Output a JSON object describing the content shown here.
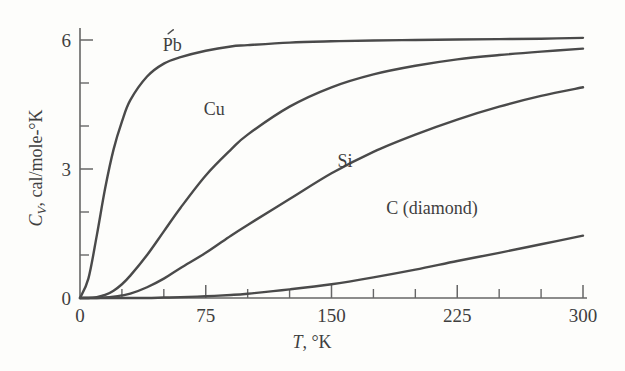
{
  "figure": {
    "background_color": "#fdfdfb",
    "ink_color": "#4a4a4a",
    "axis_color": "#666666"
  },
  "chart_data": {
    "type": "line",
    "title": "",
    "subtitle": "",
    "xlabel_parts": {
      "symbol": "T",
      "rest": ", °K"
    },
    "xlabel": "T, °K",
    "ylabel_parts": {
      "symbol": "C",
      "subscript": "V",
      "rest": ", cal/mole-°K"
    },
    "ylabel": "C_V, cal/mole-°K",
    "xlim": [
      0,
      300
    ],
    "ylim": [
      0,
      6.3
    ],
    "grid": false,
    "legend_position": "inline-curve-labels",
    "x_major_ticks": [
      0,
      75,
      150,
      225,
      300
    ],
    "x_major_tick_labels": [
      "0",
      "75",
      "150",
      "225",
      "300"
    ],
    "x_minor_ticks": [
      25,
      50,
      100,
      125,
      175,
      200,
      250,
      275
    ],
    "y_major_ticks": [
      0,
      3,
      6
    ],
    "y_major_tick_labels": [
      "0",
      "3",
      "6"
    ],
    "y_minor_ticks": [
      1,
      2,
      4,
      5
    ],
    "x": [
      0,
      5,
      10,
      15,
      20,
      25,
      30,
      40,
      50,
      60,
      75,
      90,
      100,
      125,
      150,
      175,
      200,
      225,
      250,
      275,
      300
    ],
    "series": [
      {
        "name": "Pb",
        "label": "Pb",
        "label_x": 55,
        "label_y": 5.75,
        "debye_temperature": 88,
        "values": [
          0.0,
          0.45,
          1.45,
          2.55,
          3.45,
          4.1,
          4.6,
          5.15,
          5.45,
          5.6,
          5.75,
          5.85,
          5.88,
          5.94,
          5.97,
          5.99,
          6.0,
          6.01,
          6.02,
          6.03,
          6.05
        ]
      },
      {
        "name": "Cu",
        "label": "Cu",
        "label_x": 80,
        "label_y": 4.25,
        "debye_temperature": 315,
        "values": [
          0.0,
          0.0,
          0.02,
          0.07,
          0.17,
          0.32,
          0.52,
          1.0,
          1.55,
          2.1,
          2.85,
          3.45,
          3.8,
          4.45,
          4.9,
          5.2,
          5.4,
          5.55,
          5.65,
          5.73,
          5.8
        ]
      },
      {
        "name": "Si",
        "label": "Si",
        "label_x": 158,
        "label_y": 3.05,
        "debye_temperature": 625,
        "values": [
          0.0,
          0.0,
          0.0,
          0.01,
          0.03,
          0.06,
          0.1,
          0.25,
          0.45,
          0.7,
          1.05,
          1.45,
          1.7,
          2.3,
          2.9,
          3.4,
          3.8,
          4.15,
          4.45,
          4.7,
          4.9
        ]
      },
      {
        "name": "C (diamond)",
        "label": "C (diamond)",
        "label_x": 210,
        "label_y": 1.95,
        "debye_temperature": 1860,
        "values": [
          0.0,
          0.0,
          0.0,
          0.0,
          0.0,
          0.0,
          0.0,
          0.0,
          0.01,
          0.02,
          0.04,
          0.07,
          0.1,
          0.2,
          0.32,
          0.48,
          0.66,
          0.86,
          1.05,
          1.25,
          1.45
        ]
      }
    ]
  }
}
